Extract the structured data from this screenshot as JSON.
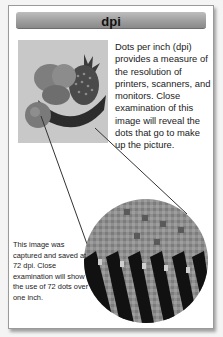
{
  "header": {
    "title": "dpi"
  },
  "description": "Dots per inch (dpi) provides a measure of the resolution of printers, scanners, and monitors. Close examination of this image will reveal the dots that go to make up the picture.",
  "photo": {
    "subject": "fruit-basket-photo",
    "alt": "Bowl of fruit with pineapple"
  },
  "magnified": {
    "subject": "magnified-pixel-circle"
  },
  "caption": "This image was captured and saved at 72 dpi. Close examination will show the use of 72 dots over one inch.",
  "colors": {
    "header_bar": "#9c9c9c",
    "card_border": "#9a9a9a",
    "background": "#ffffff"
  }
}
